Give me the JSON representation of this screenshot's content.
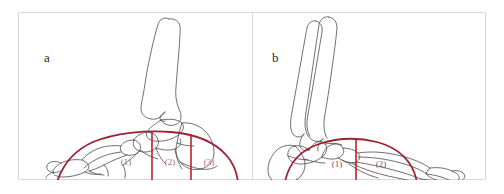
{
  "figure": {
    "background_color": "#ffffff",
    "frame_border_color": "#d8d8d8",
    "panel_divider_color": "#d8d8d8"
  },
  "colors": {
    "bone_outline": "#4a4a4a",
    "arch_curve": "#a02030",
    "divider_line": "#c0202c",
    "ground_line": "#5a5a5a",
    "label_text": "#b06a72",
    "panel_letter": "#2a2a2a"
  },
  "panels": [
    {
      "id": "panel-a",
      "letter": "a",
      "letter_x": 44,
      "letter_y": 50,
      "description": "Lateral view of flattened foot skeleton with low medial arch, tibia angled posteriorly",
      "arch_type": "low-arch",
      "bone_count_visible": "tibia, talus, calcaneus, navicular, cuneiforms, metatarsals, phalanges",
      "segments": [
        {
          "label": "(1)",
          "x": 126,
          "y": 161
        },
        {
          "label": "(2)",
          "x": 170,
          "y": 161
        },
        {
          "label": "(3)",
          "x": 209,
          "y": 161
        }
      ],
      "vertical_dividers": [
        {
          "x": 152,
          "y_top": 131,
          "y_bottom": 173
        },
        {
          "x": 191,
          "y_top": 134,
          "y_bottom": 173
        }
      ],
      "ground_line": {
        "x1": 36,
        "y": 172,
        "x2": 238,
        "thickness": 4
      }
    },
    {
      "id": "panel-b",
      "letter": "b",
      "letter_x": 272,
      "letter_y": 50,
      "description": "Lateral view of high-arched foot skeleton with raised medial arch, tibia and fibula near vertical",
      "arch_type": "high-arch",
      "bone_count_visible": "tibia, fibula, talus, calcaneus, navicular, cuneiforms, metatarsals, phalanges",
      "segments": [
        {
          "label": "(1)",
          "x": 340,
          "y": 163
        },
        {
          "label": "(2)",
          "x": 382,
          "y": 163
        }
      ],
      "vertical_dividers": [
        {
          "x": 356,
          "y_top": 132,
          "y_bottom": 173
        }
      ],
      "ground_line": {
        "x1": 272,
        "y": 172,
        "x2": 474,
        "thickness": 4
      }
    }
  ]
}
